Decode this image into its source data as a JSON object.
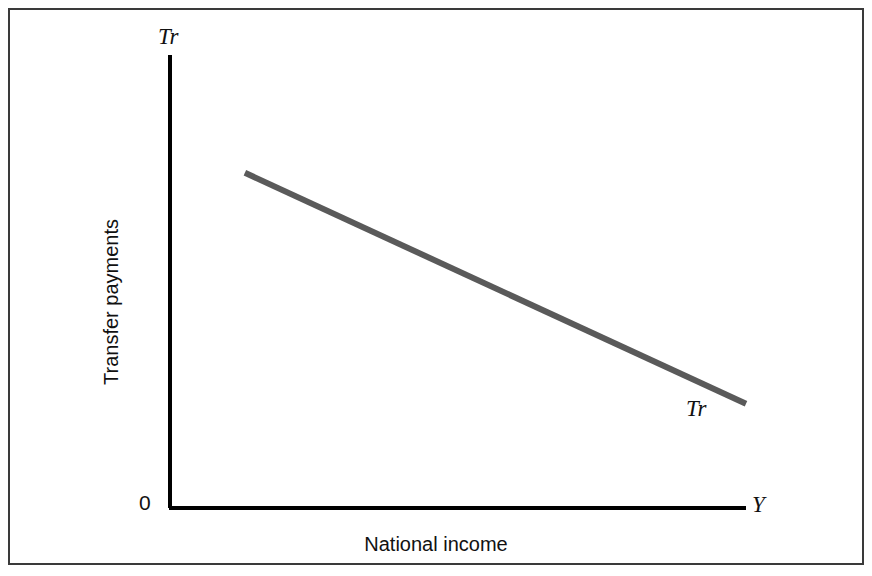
{
  "figure": {
    "origin_label": "0",
    "yaxis_end_label": "Tr",
    "xaxis_end_label": "Y",
    "curve_label": "Tr",
    "xaxis_title": "National income",
    "yaxis_title": "Transfer payments",
    "frame_color": "#3a3a3a",
    "axis_color": "#000000",
    "curve_color": "#5a5a5a",
    "background_color": "#ffffff"
  },
  "chart_data": {
    "type": "line",
    "title": "",
    "xlabel": "National income",
    "ylabel": "Transfer payments",
    "x_axis_symbol": "Y",
    "y_axis_symbol": "Tr",
    "origin": "0",
    "grid": false,
    "legend": null,
    "annotations": [
      {
        "text": "Tr",
        "position": "curve-right-end",
        "style": "italic"
      },
      {
        "text": "Tr",
        "position": "y-axis-top",
        "style": "italic"
      },
      {
        "text": "Y",
        "position": "x-axis-right",
        "style": "italic"
      },
      {
        "text": "0",
        "position": "origin",
        "style": "regular"
      }
    ],
    "axis_ranges": {
      "x": [
        0,
        1
      ],
      "y": [
        0,
        1
      ]
    },
    "ticks": {
      "x": [],
      "y": []
    },
    "series": [
      {
        "name": "Tr",
        "description": "Transfer payments decline linearly as national income rises",
        "x": [
          0.13,
          1.0
        ],
        "y": [
          0.74,
          0.23
        ]
      }
    ]
  }
}
